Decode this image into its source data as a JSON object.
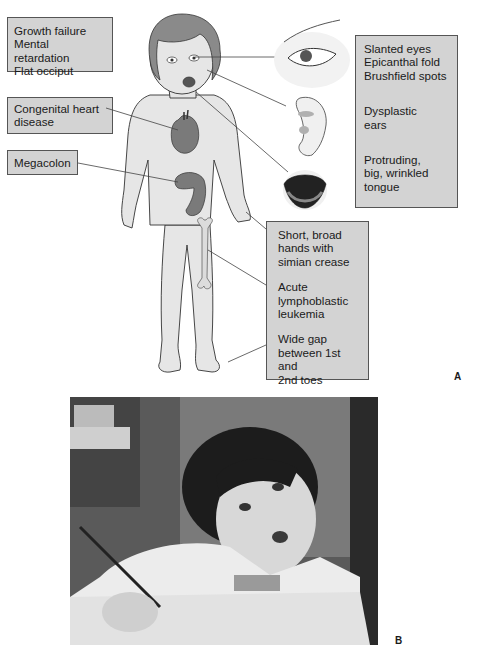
{
  "panel_a": {
    "letter": "A",
    "left_labels": [
      {
        "lines": [
          "Growth failure",
          "Mental retardation",
          "Flat occiput"
        ]
      },
      {
        "lines": [
          "Congenital heart",
          "disease"
        ]
      },
      {
        "lines": [
          "Megacolon"
        ]
      }
    ],
    "right_box": {
      "groups": [
        {
          "lines": [
            "Slanted eyes",
            "Epicanthal fold",
            "Brushfield spots"
          ]
        },
        {
          "lines": [
            "Dysplastic",
            "ears"
          ]
        },
        {
          "lines": [
            "Protruding,",
            "big, wrinkled",
            "tongue"
          ]
        }
      ]
    },
    "bottom_box": {
      "groups": [
        {
          "lines": [
            "Short, broad",
            "hands with",
            "simian crease"
          ]
        },
        {
          "lines": [
            "Acute",
            "lymphoblastic",
            "leukemia"
          ]
        },
        {
          "lines": [
            "Wide gap",
            "between 1st and",
            "2nd toes"
          ]
        }
      ]
    },
    "illustrations": [
      "child-figure",
      "eye-closeup",
      "ear-closeup",
      "tongue-closeup",
      "heart",
      "colon",
      "bone"
    ]
  },
  "panel_b": {
    "letter": "B",
    "photo_description": "black-and-white photograph of child writing with pencil at desk"
  },
  "colors": {
    "box_fill": "#d3d3d3",
    "skin": "#e6e6e6",
    "hair": "#8a8a8a",
    "organ": "#7a7a7a"
  }
}
